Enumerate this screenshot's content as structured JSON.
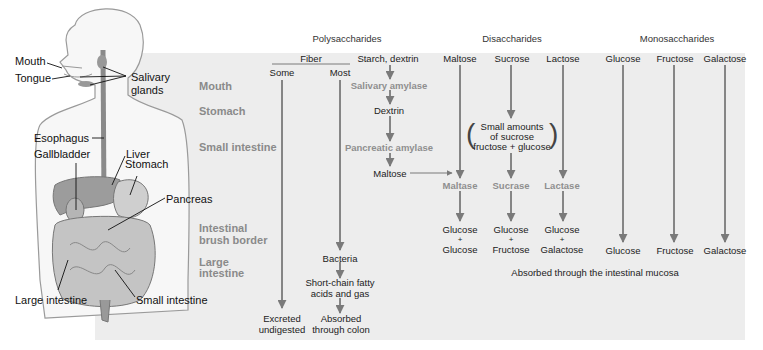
{
  "anatomy": {
    "labels": {
      "mouth": "Mouth",
      "tongue": "Tongue",
      "salivary_glands": [
        "Salivary",
        "glands"
      ],
      "esophagus": "Esophagus",
      "gallbladder": "Gallbladder",
      "liver": "Liver",
      "stomach": "Stomach",
      "pancreas": "Pancreas",
      "large_intestine": "Large intestine",
      "small_intestine": "Small intestine"
    }
  },
  "rows": {
    "mouth": "Mouth",
    "stomach": "Stomach",
    "small_intestine": "Small intestine",
    "brush_border": [
      "Intestinal",
      "brush border"
    ],
    "large_intestine": [
      "Large",
      "intestine"
    ]
  },
  "sections": {
    "polysaccharides": "Polysaccharides",
    "disaccharides": "Disaccharides",
    "monosaccharides": "Monosaccharides"
  },
  "polysaccharides": {
    "fiber": "Fiber",
    "some": "Some",
    "most": "Most",
    "starch": "Starch, dextrin",
    "salivary_amylase": "Salivary amylase",
    "dextrin": "Dextrin",
    "pancreatic_amylase": "Pancreatic amylase",
    "maltose": "Maltose",
    "bacteria": "Bacteria",
    "scfa": [
      "Short-chain fatty",
      "acids and gas"
    ],
    "absorbed_colon": [
      "Absorbed",
      "through colon"
    ],
    "excreted": [
      "Excreted",
      "undigested"
    ]
  },
  "disaccharides": {
    "maltose": "Maltose",
    "sucrose": "Sucrose",
    "lactose": "Lactose",
    "small_amounts": [
      "Small amounts",
      "of sucrose",
      "fructose + glucose"
    ],
    "maltase": "Maltase",
    "sucrase": "Sucrase",
    "lactase": "Lactase",
    "products": [
      [
        "Glucose",
        "+",
        "Glucose"
      ],
      [
        "Glucose",
        "+",
        "Fructose"
      ],
      [
        "Glucose",
        "+",
        "Galactose"
      ]
    ]
  },
  "monosaccharides": {
    "heads": [
      "Glucose",
      "Fructose",
      "Galactose"
    ],
    "products": [
      "Glucose",
      "Fructose",
      "Galactose"
    ]
  },
  "footer": {
    "absorbed_mucosa": "Absorbed through the intestinal mucosa"
  },
  "colors": {
    "panel": "#ededed",
    "arrow": "#7a7a7a",
    "row_label": "#8a8a8a",
    "enzyme": "#8f8f8f"
  }
}
